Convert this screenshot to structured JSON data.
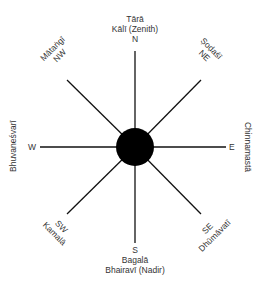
{
  "diagram": {
    "type": "compass-mandala",
    "center": {
      "x": 135,
      "y": 147,
      "radius": 19,
      "fill": "#000000"
    },
    "line_color": "#111111",
    "directions": {
      "N": {
        "dir": "N",
        "deity": "Tārā",
        "deity2": "Kālī (Zenith)"
      },
      "NE": {
        "dir": "NE",
        "deity": "Ṣoḍaśī"
      },
      "E": {
        "dir": "E",
        "deity": "Chinnamastā"
      },
      "SE": {
        "dir": "SE",
        "deity": "Dhūmāvatī"
      },
      "S": {
        "dir": "S",
        "deity": "Bagalā",
        "deity2": "Bhairavī (Nadir)"
      },
      "SW": {
        "dir": "SW",
        "deity": "Kamalā"
      },
      "W": {
        "dir": "W",
        "deity": "Bhuvaneśvarī"
      },
      "NW": {
        "dir": "NW",
        "deity": "Mātaṅgī"
      }
    }
  }
}
